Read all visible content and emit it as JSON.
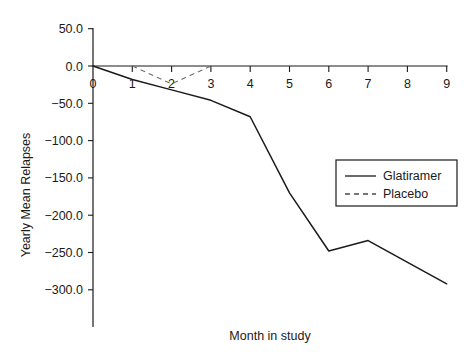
{
  "chart_data": {
    "type": "line",
    "title": "",
    "xlabel": "Month in study",
    "ylabel": "Yearly Mean Relapses",
    "xlim": [
      0,
      9
    ],
    "ylim": [
      -300,
      50
    ],
    "grid": false,
    "legend_position": "right-middle",
    "x_ticks": [
      "0",
      "1",
      "2",
      "3",
      "4",
      "5",
      "6",
      "7",
      "8",
      "9"
    ],
    "x_tick_values": [
      0,
      1,
      2,
      3,
      4,
      5,
      6,
      7,
      8,
      9
    ],
    "y_ticks": [
      "50.0",
      "0.0",
      "-50.0",
      "-100.0",
      "-150.0",
      "-200.0",
      "-250.0",
      "-300.0"
    ],
    "y_tick_values": [
      50,
      0,
      -50,
      -100,
      -150,
      -200,
      -250,
      -300
    ],
    "series": [
      {
        "name": "Glatiramer",
        "style": "solid",
        "color": "#1a1a1a",
        "x": [
          0,
          1,
          2,
          3,
          4,
          5,
          6,
          7,
          9
        ],
        "values": [
          0,
          -18,
          -32,
          -46,
          -68,
          -170,
          -248,
          -234,
          -292
        ]
      },
      {
        "name": "Placebo",
        "style": "dashed",
        "color": "#6f6f6f",
        "x": [
          1,
          2,
          3
        ],
        "values": [
          0,
          -24,
          0
        ]
      }
    ]
  },
  "legend": {
    "entries": [
      {
        "label": "Glatiramer",
        "style": "solid"
      },
      {
        "label": "Placebo",
        "style": "dashed"
      }
    ]
  },
  "colors": {
    "axis": "#1a1a1a",
    "glatiramer": "#1a1a1a",
    "placebo": "#6f6f6f",
    "background": "#ffffff"
  }
}
